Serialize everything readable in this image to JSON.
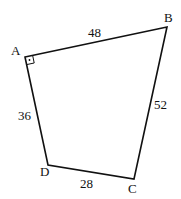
{
  "diagram": {
    "type": "quadrilateral",
    "vertices": [
      {
        "name": "A",
        "x": 25,
        "y": 57,
        "label_x": 11,
        "label_y": 55
      },
      {
        "name": "B",
        "x": 167,
        "y": 27,
        "label_x": 164,
        "label_y": 22
      },
      {
        "name": "C",
        "x": 134,
        "y": 179,
        "label_x": 128,
        "label_y": 193
      },
      {
        "name": "D",
        "x": 48,
        "y": 165,
        "label_x": 40,
        "label_y": 176
      }
    ],
    "sides": [
      {
        "from": "A",
        "to": "B",
        "length": "48",
        "label_x": 89,
        "label_y": 37
      },
      {
        "from": "B",
        "to": "C",
        "length": "52",
        "label_x": 155,
        "label_y": 109
      },
      {
        "from": "C",
        "to": "D",
        "length": "28",
        "label_x": 80,
        "label_y": 188
      },
      {
        "from": "D",
        "to": "A",
        "length": "36",
        "label_x": 18,
        "label_y": 120
      }
    ],
    "right_angle_at": "A",
    "stroke_color": "#111111"
  }
}
